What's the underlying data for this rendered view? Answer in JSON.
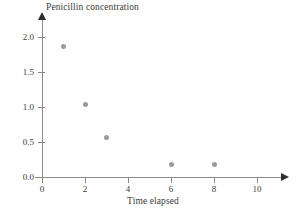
{
  "chart_data": {
    "type": "scatter",
    "title": "Penicillin concentration",
    "xlabel": "Time elapsed",
    "ylabel": "",
    "x": [
      1,
      2,
      3,
      6,
      8
    ],
    "values": [
      1.86,
      1.04,
      0.56,
      0.18,
      0.18
    ],
    "points": [
      {
        "x": 1,
        "y": 1.86
      },
      {
        "x": 2,
        "y": 1.04
      },
      {
        "x": 3,
        "y": 0.56
      },
      {
        "x": 6,
        "y": 0.18
      },
      {
        "x": 8,
        "y": 0.18
      }
    ],
    "xlim": [
      0,
      11.3
    ],
    "ylim": [
      0.0,
      2.28
    ],
    "xticks": [
      0,
      2,
      4,
      6,
      8,
      10
    ],
    "xticklabels": [
      "0",
      "2",
      "4",
      "6",
      "8",
      "10"
    ],
    "yticks": [
      0.0,
      0.5,
      1.0,
      1.5,
      2.0
    ],
    "yticklabels": [
      "0.0",
      "0.5",
      "1.0",
      "1.5",
      "2.0"
    ],
    "grid": false,
    "legend": null,
    "marker_color": "#9a9a9a",
    "axis_color": "#8a8a8a",
    "text_color": "#3a3a3a",
    "background": "#ffffff",
    "x_axis_arrow": true,
    "y_axis_arrow": true
  }
}
